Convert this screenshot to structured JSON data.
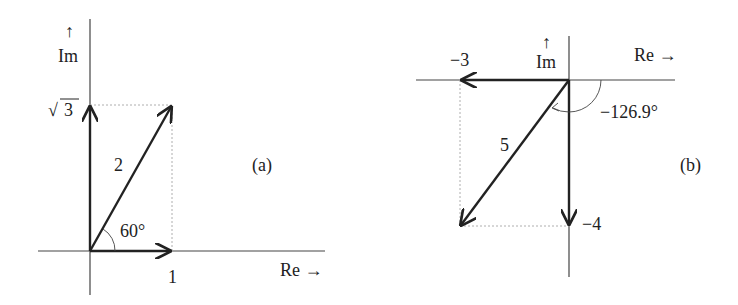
{
  "panels": {
    "a": {
      "tag": "(a)",
      "axis_im": "Im",
      "axis_im_arrow": "↑",
      "axis_re": "Re →",
      "im_value": "3",
      "im_sqrt": "√",
      "re_value": "1",
      "magnitude": "2",
      "angle": "60°"
    },
    "b": {
      "tag": "(b)",
      "axis_im": "Im",
      "axis_im_arrow": "↑",
      "axis_re": "Re →",
      "re_value": "−3",
      "im_value": "−4",
      "magnitude": "5",
      "angle": "−126.9°"
    }
  },
  "colors": {
    "ink": "#222222",
    "axis": "#444444",
    "dotted": "#999999"
  }
}
